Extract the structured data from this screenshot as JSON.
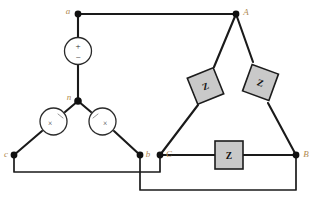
{
  "diagram": {
    "colors": {
      "wire": "#1a1a1a",
      "node_label": "#b08a52",
      "impedance_fill": "#c9c9c9",
      "impedance_border": "#1c1c1c",
      "background": "#ffffff"
    }
  },
  "source": {
    "type": "wye",
    "neutral_label": "n",
    "phase_labels": {
      "a": "a",
      "b": "b",
      "c": "c"
    },
    "elements": [
      {
        "id": "source-phase-a",
        "symbol": "voltage-source",
        "plus": "+",
        "minus": "−",
        "terminal": "a"
      },
      {
        "id": "source-phase-c",
        "symbol": "voltage-source-rotated",
        "mark": "×",
        "terminal": "c"
      },
      {
        "id": "source-phase-b",
        "symbol": "voltage-source-rotated",
        "mark": "×",
        "terminal": "b"
      }
    ]
  },
  "load": {
    "type": "delta",
    "terminal_labels": {
      "A": "A",
      "B": "B",
      "C": "C"
    },
    "impedances": [
      {
        "id": "impedance-CA",
        "label": "Z",
        "between": "C-A",
        "orientation": "tilted"
      },
      {
        "id": "impedance-AB",
        "label": "Z",
        "between": "A-B",
        "orientation": "tilted"
      },
      {
        "id": "impedance-CB",
        "label": "Z",
        "between": "C-B",
        "orientation": "horizontal"
      }
    ]
  },
  "connections": [
    {
      "from": "a",
      "to": "A",
      "path": "top-horizontal"
    },
    {
      "from": "c",
      "to": "C",
      "path": "lower-horizontal"
    },
    {
      "from": "b",
      "to": "B",
      "path": "bottom-horizontal"
    }
  ]
}
